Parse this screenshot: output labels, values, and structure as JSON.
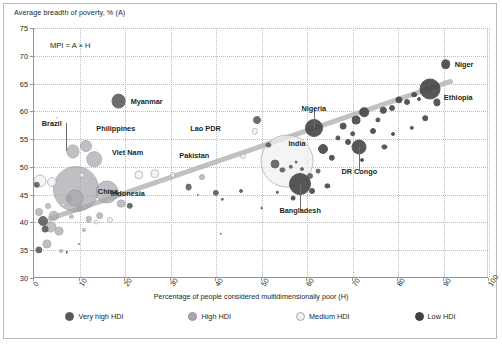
{
  "figure": {
    "frame": true,
    "background": "#ffffff"
  },
  "annotation": {
    "mpi_note": "MPI = A × H"
  },
  "legend": {
    "items": [
      {
        "label": "Very high HDI",
        "color": "#58595b",
        "stroke": "#58595b"
      },
      {
        "label": "High HDI",
        "color": "#a7a9ac",
        "stroke": "#939598"
      },
      {
        "label": "Medium HDI",
        "color": "#f1f1f2",
        "stroke": "#a7a9ac"
      },
      {
        "label": "Low HDI",
        "color": "#414042",
        "stroke": "#414042"
      }
    ]
  },
  "chart_data": {
    "type": "scatter",
    "title": "",
    "xlabel": "Percentage of people considered multidimensionally poor (H)",
    "ylabel": "Average breadth of poverty, % (A)",
    "xlim": [
      0,
      100
    ],
    "ylim": [
      30,
      75
    ],
    "xticks": [
      0,
      10,
      20,
      30,
      40,
      50,
      60,
      70,
      80,
      90,
      100
    ],
    "yticks": [
      30,
      35,
      40,
      45,
      50,
      55,
      60,
      65,
      70,
      75
    ],
    "grid": true,
    "legend_position": "bottom",
    "size_encoding": "population (bubble area)",
    "color_encoding": "HDI group",
    "trendline": {
      "visible": true,
      "x0": 3,
      "y0": 40.5,
      "x1": 92,
      "y1": 65.5
    },
    "points": [
      {
        "name": "Myanmar",
        "x": 18.6,
        "y": 61.9,
        "r": 7.4,
        "group": "Very high HDI",
        "labeled": true,
        "label_dx": 10,
        "label_dy": 0
      },
      {
        "name": "Brazil",
        "x": 8.5,
        "y": 52.8,
        "r": 6.6,
        "group": "High HDI",
        "labeled": true,
        "label_dx": -7,
        "label_dy": -28,
        "leader": true
      },
      {
        "name": "Philippines",
        "x": 11.5,
        "y": 53.8,
        "r": 6.0,
        "group": "High HDI",
        "labeled": true,
        "label_dx": 8,
        "label_dy": -18
      },
      {
        "name": "Viet Nam",
        "x": 13.2,
        "y": 51.4,
        "r": 7.8,
        "group": "High HDI",
        "labeled": true,
        "label_dx": 16,
        "label_dy": -7
      },
      {
        "name": "China",
        "x": 9.2,
        "y": 46.0,
        "r": 23.0,
        "group": "High HDI",
        "labeled": true,
        "label_dx": 20,
        "label_dy": 2
      },
      {
        "name": "Indonesia",
        "x": 16.0,
        "y": 45.5,
        "r": 11.5,
        "group": "High HDI",
        "labeled": true,
        "label_dx": 2,
        "label_dy": 1
      },
      {
        "name": "Lao PDR",
        "x": 48.5,
        "y": 56.4,
        "r": 3.2,
        "group": "Medium HDI",
        "labeled": true,
        "label_dx": -30,
        "label_dy": -3
      },
      {
        "name": "Pakistan",
        "x": 46.0,
        "y": 52.0,
        "r": 3.0,
        "group": "Medium HDI",
        "labeled": true,
        "label_dx": -30,
        "label_dy": -1
      },
      {
        "name": "India",
        "x": 55.5,
        "y": 51.0,
        "r": 26.5,
        "group": "Medium HDI",
        "labeled": true,
        "label_dx": 0,
        "label_dy": -18
      },
      {
        "name": "Nigeria",
        "x": 61.5,
        "y": 57.0,
        "r": 9.0,
        "group": "Low HDI",
        "labeled": true,
        "label_dx": 0,
        "label_dy": -20,
        "leader": true
      },
      {
        "name": "Bangladesh",
        "x": 58.5,
        "y": 47.0,
        "r": 11.0,
        "group": "Low HDI",
        "labeled": true,
        "label_dx": 0,
        "label_dy": 26,
        "leader": true
      },
      {
        "name": "DR Congo",
        "x": 71.5,
        "y": 53.5,
        "r": 7.5,
        "group": "Low HDI",
        "labeled": true,
        "label_dx": 0,
        "label_dy": 24,
        "leader": true
      },
      {
        "name": "Ethiopia",
        "x": 87.0,
        "y": 64.0,
        "r": 10.5,
        "group": "Low HDI",
        "labeled": true,
        "label_dx": 12,
        "label_dy": 8
      },
      {
        "name": "Niger",
        "x": 90.5,
        "y": 68.5,
        "r": 4.8,
        "group": "Low HDI",
        "labeled": true,
        "label_dx": 7,
        "label_dy": 0
      },
      {
        "name": "",
        "x": 0.6,
        "y": 46.8,
        "r": 3.2,
        "group": "Very high HDI",
        "labeled": false
      },
      {
        "name": "",
        "x": 1.4,
        "y": 47.5,
        "r": 6.5,
        "group": "Medium HDI",
        "labeled": false
      },
      {
        "name": "",
        "x": 2.0,
        "y": 40.2,
        "r": 5.0,
        "group": "Very high HDI",
        "labeled": false
      },
      {
        "name": "",
        "x": 1.2,
        "y": 41.8,
        "r": 4.0,
        "group": "High HDI",
        "labeled": false
      },
      {
        "name": "",
        "x": 2.4,
        "y": 38.8,
        "r": 3.4,
        "group": "Very high HDI",
        "labeled": false
      },
      {
        "name": "",
        "x": 1.0,
        "y": 35.0,
        "r": 3.6,
        "group": "Very high HDI",
        "labeled": false
      },
      {
        "name": "",
        "x": 2.8,
        "y": 36.2,
        "r": 4.6,
        "group": "High HDI",
        "labeled": false
      },
      {
        "name": "",
        "x": 3.6,
        "y": 39.2,
        "r": 5.6,
        "group": "High HDI",
        "labeled": false
      },
      {
        "name": "",
        "x": 4.4,
        "y": 41.2,
        "r": 5.2,
        "group": "High HDI",
        "labeled": false
      },
      {
        "name": "",
        "x": 5.6,
        "y": 38.4,
        "r": 4.4,
        "group": "High HDI",
        "labeled": false
      },
      {
        "name": "",
        "x": 3.0,
        "y": 43.0,
        "r": 3.0,
        "group": "High HDI",
        "labeled": false
      },
      {
        "name": "",
        "x": 6.4,
        "y": 43.2,
        "r": 2.4,
        "group": "Medium HDI",
        "labeled": false
      },
      {
        "name": "",
        "x": 5.0,
        "y": 58.8,
        "r": 1.0,
        "group": "Medium HDI",
        "labeled": false
      },
      {
        "name": "",
        "x": 4.0,
        "y": 47.2,
        "r": 5.0,
        "group": "Medium HDI",
        "labeled": false
      },
      {
        "name": "",
        "x": 7.6,
        "y": 44.3,
        "r": 3.4,
        "group": "High HDI",
        "labeled": false
      },
      {
        "name": "",
        "x": 8.2,
        "y": 41.0,
        "r": 2.2,
        "group": "High HDI",
        "labeled": false
      },
      {
        "name": "",
        "x": 6.0,
        "y": 34.8,
        "r": 2.0,
        "group": "High HDI",
        "labeled": false
      },
      {
        "name": "",
        "x": 7.2,
        "y": 34.6,
        "r": 1.2,
        "group": "Very high HDI",
        "labeled": false
      },
      {
        "name": "",
        "x": 9.8,
        "y": 36.2,
        "r": 1.0,
        "group": "Very high HDI",
        "labeled": false
      },
      {
        "name": "",
        "x": 10.6,
        "y": 48.5,
        "r": 3.0,
        "group": "Medium HDI",
        "labeled": false
      },
      {
        "name": "",
        "x": 9.0,
        "y": 44.4,
        "r": 8.5,
        "group": "High HDI",
        "labeled": false
      },
      {
        "name": "",
        "x": 10.0,
        "y": 42.6,
        "r": 2.8,
        "group": "High HDI",
        "labeled": false
      },
      {
        "name": "",
        "x": 12.0,
        "y": 40.6,
        "r": 3.2,
        "group": "High HDI",
        "labeled": false
      },
      {
        "name": "",
        "x": 13.6,
        "y": 40.0,
        "r": 2.4,
        "group": "Medium HDI",
        "labeled": false
      },
      {
        "name": "",
        "x": 14.4,
        "y": 41.2,
        "r": 3.8,
        "group": "High HDI",
        "labeled": false
      },
      {
        "name": "",
        "x": 16.6,
        "y": 40.4,
        "r": 3.0,
        "group": "Medium HDI",
        "labeled": false
      },
      {
        "name": "",
        "x": 11.0,
        "y": 38.6,
        "r": 2.0,
        "group": "High HDI",
        "labeled": false
      },
      {
        "name": "",
        "x": 19.2,
        "y": 43.4,
        "r": 4.4,
        "group": "High HDI",
        "labeled": false
      },
      {
        "name": "",
        "x": 21.0,
        "y": 43.0,
        "r": 3.2,
        "group": "Very high HDI",
        "labeled": false
      },
      {
        "name": "",
        "x": 23.0,
        "y": 48.6,
        "r": 4.6,
        "group": "Medium HDI",
        "labeled": false
      },
      {
        "name": "",
        "x": 26.5,
        "y": 48.8,
        "r": 4.8,
        "group": "Medium HDI",
        "labeled": false
      },
      {
        "name": "",
        "x": 30.5,
        "y": 48.5,
        "r": 3.0,
        "group": "Medium HDI",
        "labeled": false
      },
      {
        "name": "",
        "x": 34.0,
        "y": 46.4,
        "r": 3.4,
        "group": "Very high HDI",
        "labeled": false
      },
      {
        "name": "",
        "x": 37.0,
        "y": 48.2,
        "r": 3.0,
        "group": "High HDI",
        "labeled": false
      },
      {
        "name": "",
        "x": 36.0,
        "y": 45.0,
        "r": 1.2,
        "group": "Very high HDI",
        "labeled": false
      },
      {
        "name": "",
        "x": 40.0,
        "y": 45.3,
        "r": 3.2,
        "group": "Very high HDI",
        "labeled": false
      },
      {
        "name": "",
        "x": 41.4,
        "y": 44.2,
        "r": 1.2,
        "group": "Very high HDI",
        "labeled": false
      },
      {
        "name": "",
        "x": 45.4,
        "y": 45.6,
        "r": 2.0,
        "group": "Very high HDI",
        "labeled": false
      },
      {
        "name": "",
        "x": 41.0,
        "y": 38.0,
        "r": 1.2,
        "group": "Very high HDI",
        "labeled": false
      },
      {
        "name": "",
        "x": 49.0,
        "y": 58.5,
        "r": 4.0,
        "group": "Very high HDI",
        "labeled": false
      },
      {
        "name": "",
        "x": 51.5,
        "y": 54.0,
        "r": 2.6,
        "group": "Very high HDI",
        "labeled": false
      },
      {
        "name": "",
        "x": 53.0,
        "y": 50.5,
        "r": 4.5,
        "group": "Very high HDI",
        "labeled": false
      },
      {
        "name": "",
        "x": 54.6,
        "y": 49.4,
        "r": 2.6,
        "group": "Very high HDI",
        "labeled": false
      },
      {
        "name": "",
        "x": 56.4,
        "y": 50.0,
        "r": 2.2,
        "group": "Very high HDI",
        "labeled": false
      },
      {
        "name": "",
        "x": 57.6,
        "y": 50.8,
        "r": 1.4,
        "group": "Very high HDI",
        "labeled": false
      },
      {
        "name": "",
        "x": 59.0,
        "y": 49.6,
        "r": 2.0,
        "group": "Very high HDI",
        "labeled": false
      },
      {
        "name": "",
        "x": 60.6,
        "y": 48.4,
        "r": 3.0,
        "group": "Very high HDI",
        "labeled": false
      },
      {
        "name": "",
        "x": 62.5,
        "y": 49.2,
        "r": 2.4,
        "group": "Very high HDI",
        "labeled": false
      },
      {
        "name": "",
        "x": 63.5,
        "y": 53.2,
        "r": 5.0,
        "group": "Low HDI",
        "labeled": false
      },
      {
        "name": "",
        "x": 65.5,
        "y": 51.6,
        "r": 3.2,
        "group": "Low HDI",
        "labeled": false
      },
      {
        "name": "",
        "x": 64.5,
        "y": 46.6,
        "r": 2.6,
        "group": "Low HDI",
        "labeled": false
      },
      {
        "name": "",
        "x": 66.8,
        "y": 55.2,
        "r": 2.6,
        "group": "Low HDI",
        "labeled": false
      },
      {
        "name": "",
        "x": 68.0,
        "y": 57.4,
        "r": 3.4,
        "group": "Low HDI",
        "labeled": false
      },
      {
        "name": "",
        "x": 70.0,
        "y": 56.0,
        "r": 2.8,
        "group": "Low HDI",
        "labeled": false
      },
      {
        "name": "",
        "x": 70.8,
        "y": 58.4,
        "r": 4.4,
        "group": "Low HDI",
        "labeled": false
      },
      {
        "name": "",
        "x": 72.6,
        "y": 59.8,
        "r": 4.8,
        "group": "Low HDI",
        "labeled": false
      },
      {
        "name": "",
        "x": 69.0,
        "y": 54.4,
        "r": 3.0,
        "group": "Low HDI",
        "labeled": false
      },
      {
        "name": "",
        "x": 72.0,
        "y": 51.2,
        "r": 2.0,
        "group": "Low HDI",
        "labeled": false
      },
      {
        "name": "",
        "x": 74.5,
        "y": 56.5,
        "r": 3.0,
        "group": "Low HDI",
        "labeled": false
      },
      {
        "name": "",
        "x": 75.5,
        "y": 58.4,
        "r": 2.6,
        "group": "Low HDI",
        "labeled": false
      },
      {
        "name": "",
        "x": 76.8,
        "y": 60.2,
        "r": 3.2,
        "group": "Low HDI",
        "labeled": false
      },
      {
        "name": "",
        "x": 78.6,
        "y": 60.6,
        "r": 3.0,
        "group": "Low HDI",
        "labeled": false
      },
      {
        "name": "",
        "x": 80.2,
        "y": 62.0,
        "r": 3.6,
        "group": "Low HDI",
        "labeled": false
      },
      {
        "name": "",
        "x": 82.0,
        "y": 61.6,
        "r": 3.0,
        "group": "Low HDI",
        "labeled": false
      },
      {
        "name": "",
        "x": 83.6,
        "y": 63.0,
        "r": 2.8,
        "group": "Low HDI",
        "labeled": false
      },
      {
        "name": "",
        "x": 84.6,
        "y": 62.2,
        "r": 2.0,
        "group": "Low HDI",
        "labeled": false
      },
      {
        "name": "",
        "x": 88.5,
        "y": 61.6,
        "r": 3.6,
        "group": "Low HDI",
        "labeled": false
      },
      {
        "name": "",
        "x": 86.0,
        "y": 58.8,
        "r": 2.8,
        "group": "Low HDI",
        "labeled": false
      },
      {
        "name": "",
        "x": 83.0,
        "y": 57.0,
        "r": 2.2,
        "group": "Low HDI",
        "labeled": false
      },
      {
        "name": "",
        "x": 79.0,
        "y": 56.0,
        "r": 2.0,
        "group": "Low HDI",
        "labeled": false
      },
      {
        "name": "",
        "x": 77.0,
        "y": 53.6,
        "r": 2.6,
        "group": "Low HDI",
        "labeled": false
      },
      {
        "name": "",
        "x": 57.0,
        "y": 44.4,
        "r": 2.4,
        "group": "Low HDI",
        "labeled": false
      },
      {
        "name": "",
        "x": 61.0,
        "y": 45.6,
        "r": 3.0,
        "group": "Low HDI",
        "labeled": false
      },
      {
        "name": "",
        "x": 53.5,
        "y": 45.4,
        "r": 1.2,
        "group": "Low HDI",
        "labeled": false
      },
      {
        "name": "",
        "x": 50.0,
        "y": 42.6,
        "r": 1.4,
        "group": "Low HDI",
        "labeled": false
      }
    ]
  }
}
